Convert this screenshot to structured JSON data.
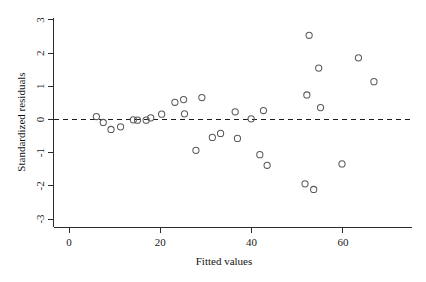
{
  "chart_data": {
    "type": "scatter",
    "title": "",
    "xlabel": "Fitted values",
    "ylabel": "Standardized residuals",
    "xlim": [
      -3,
      75
    ],
    "ylim": [
      -3.35,
      3.35
    ],
    "xticks": [
      0,
      20,
      40,
      60
    ],
    "xticklabels": [
      "0",
      "20",
      "40",
      "60"
    ],
    "yticks": [
      -3,
      -2,
      -1,
      0,
      1,
      2,
      3
    ],
    "yticklabels": [
      "-3",
      "-2",
      "-1",
      "0",
      "1",
      "2",
      "3"
    ],
    "grid": false,
    "legend": null,
    "marker": "open-circle",
    "annotations": [
      {
        "kind": "horizontal-reference-line",
        "y": 0,
        "style": "dashed",
        "label": "zero residual line"
      }
    ],
    "points": [
      {
        "x": 6.0,
        "y": 0.09
      },
      {
        "x": 7.5,
        "y": -0.09
      },
      {
        "x": 9.2,
        "y": -0.3
      },
      {
        "x": 11.3,
        "y": -0.22
      },
      {
        "x": 14.1,
        "y": -0.01
      },
      {
        "x": 15.0,
        "y": -0.02
      },
      {
        "x": 16.9,
        "y": -0.02
      },
      {
        "x": 17.9,
        "y": 0.05
      },
      {
        "x": 20.3,
        "y": 0.16
      },
      {
        "x": 23.2,
        "y": 0.52
      },
      {
        "x": 25.1,
        "y": 0.6
      },
      {
        "x": 25.3,
        "y": 0.17
      },
      {
        "x": 27.8,
        "y": -0.93
      },
      {
        "x": 29.1,
        "y": 0.66
      },
      {
        "x": 31.4,
        "y": -0.54
      },
      {
        "x": 33.2,
        "y": -0.42
      },
      {
        "x": 36.4,
        "y": 0.23
      },
      {
        "x": 36.9,
        "y": -0.57
      },
      {
        "x": 39.9,
        "y": 0.02
      },
      {
        "x": 41.8,
        "y": -1.06
      },
      {
        "x": 42.6,
        "y": 0.27
      },
      {
        "x": 43.4,
        "y": -1.38
      },
      {
        "x": 51.7,
        "y": -1.94
      },
      {
        "x": 52.1,
        "y": 0.74
      },
      {
        "x": 52.6,
        "y": 2.54
      },
      {
        "x": 53.6,
        "y": -2.11
      },
      {
        "x": 54.7,
        "y": 1.55
      },
      {
        "x": 55.1,
        "y": 0.36
      },
      {
        "x": 59.8,
        "y": -1.34
      },
      {
        "x": 63.4,
        "y": 1.86
      },
      {
        "x": 66.8,
        "y": 1.14
      }
    ]
  },
  "figure": {
    "xaxis_title": "Fitted values",
    "yaxis_title": "Standardized residuals"
  }
}
